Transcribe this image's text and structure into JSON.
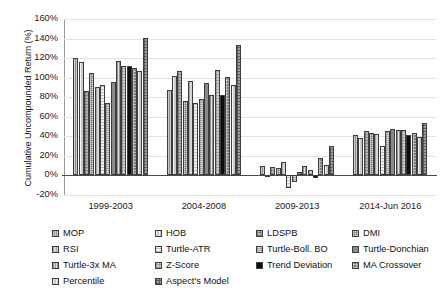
{
  "chart_data": {
    "type": "bar",
    "title": "",
    "subtitle": "",
    "xlabel": "",
    "ylabel": "Cumulative Uncompounded Return (%)",
    "categories": [
      "1999-2003",
      "2004-2008",
      "2009-2013",
      "2014-Jun 2016"
    ],
    "ylim": [
      -20,
      160
    ],
    "ytick_values": [
      -20,
      0,
      20,
      40,
      60,
      80,
      100,
      120,
      140,
      160
    ],
    "ytick_labels": [
      "-20%",
      "0%",
      "20%",
      "40%",
      "60%",
      "80%",
      "100%",
      "120%",
      "140%",
      "160%"
    ],
    "grid": true,
    "legend_position": "bottom",
    "units": "%",
    "series": [
      {
        "name": "MOP",
        "pattern": "p0",
        "values": [
          120,
          87,
          10,
          41
        ]
      },
      {
        "name": "HOB",
        "pattern": "p1",
        "values": [
          116,
          102,
          -2,
          38
        ]
      },
      {
        "name": "LDSPB",
        "pattern": "p2",
        "values": [
          86,
          107,
          9,
          45
        ]
      },
      {
        "name": "DMI",
        "pattern": "p3",
        "values": [
          105,
          76,
          8,
          43
        ]
      },
      {
        "name": "RSI",
        "pattern": "p4",
        "values": [
          90,
          97,
          14,
          42
        ]
      },
      {
        "name": "Turtle-ATR",
        "pattern": "p5",
        "values": [
          92,
          74,
          -13,
          30
        ]
      },
      {
        "name": "Turtle-Boll. BO",
        "pattern": "p6",
        "values": [
          74,
          78,
          -7,
          45
        ]
      },
      {
        "name": "Turtle-Donchian",
        "pattern": "p7",
        "values": [
          96,
          95,
          4,
          47
        ]
      },
      {
        "name": "Turtle-3x MA",
        "pattern": "p8",
        "values": [
          117,
          82,
          10,
          46
        ]
      },
      {
        "name": "Z-Score",
        "pattern": "p11",
        "values": [
          112,
          108,
          6,
          46
        ]
      },
      {
        "name": "Trend Deviation",
        "pattern": "p9",
        "values": [
          112,
          82,
          -3,
          41
        ]
      },
      {
        "name": "MA Crossover",
        "pattern": "p10",
        "values": [
          110,
          101,
          18,
          43
        ]
      },
      {
        "name": "Percentile",
        "pattern": "p1",
        "values": [
          107,
          92,
          11,
          39
        ]
      },
      {
        "name": "Aspect's Model",
        "pattern": "p12",
        "values": [
          141,
          133,
          30,
          54
        ]
      }
    ]
  },
  "legend": {
    "columns": [
      [
        "MOP",
        "RSI",
        "Turtle-3x MA",
        "Percentile"
      ],
      [
        "HOB",
        "Turtle-ATR",
        "Z-Score",
        "Aspect's Model"
      ],
      [
        "LDSPB",
        "Turtle-Boll. BO",
        "Trend Deviation"
      ],
      [
        "DMI",
        "Turtle-Donchian",
        "MA Crossover"
      ]
    ]
  }
}
